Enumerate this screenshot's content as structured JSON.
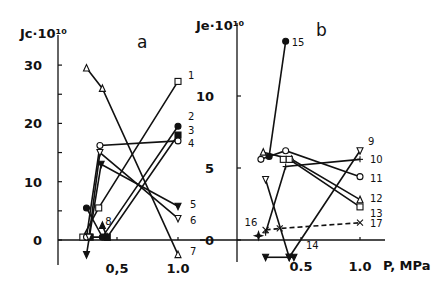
{
  "figure": {
    "panel_a_label": "a",
    "panel_b_label": "b",
    "y_axis_title_a": "Jc·10¹⁰",
    "y_axis_title_b": "Je·10¹⁰",
    "x_axis_title": "P, MPa",
    "ink_color": "#111111",
    "background": "#ffffff"
  },
  "chart_data": [
    {
      "panel": "a",
      "type": "line",
      "title": "a",
      "xlabel": "P, MPa",
      "ylabel": "Jc·10¹⁰",
      "xlim": [
        0.0,
        1.1
      ],
      "ylim": [
        -5,
        33
      ],
      "x_ticks": [
        {
          "value": 0.5,
          "label": "0,5"
        },
        {
          "value": 1.0,
          "label": "1.0"
        }
      ],
      "y_ticks": [
        {
          "value": 0,
          "label": "0"
        },
        {
          "value": 5,
          "label": ""
        },
        {
          "value": 10,
          "label": "10"
        },
        {
          "value": 15,
          "label": ""
        },
        {
          "value": 20,
          "label": "20"
        },
        {
          "value": 25,
          "label": ""
        },
        {
          "value": 30,
          "label": "30"
        }
      ],
      "grid": false,
      "series": [
        {
          "name": "1",
          "marker": "open-square",
          "x": [
            0.22,
            0.35,
            1.0
          ],
          "y": [
            0.5,
            5.5,
            27.2
          ]
        },
        {
          "name": "2",
          "marker": "filled-circle",
          "x": [
            0.25,
            0.38,
            1.0
          ],
          "y": [
            5.5,
            0.5,
            19.5
          ]
        },
        {
          "name": "3",
          "marker": "filled-square",
          "x": [
            0.28,
            0.42,
            1.0
          ],
          "y": [
            0.5,
            0.5,
            18.0
          ]
        },
        {
          "name": "4",
          "marker": "open-circle",
          "x": [
            0.25,
            0.36,
            1.0
          ],
          "y": [
            0.5,
            16.2,
            17.0
          ]
        },
        {
          "name": "5",
          "marker": "filled-down-triangle",
          "x": [
            0.25,
            0.37,
            1.0
          ],
          "y": [
            -2.5,
            13.0,
            5.8
          ]
        },
        {
          "name": "6",
          "marker": "open-down-triangle",
          "x": [
            0.27,
            0.36,
            1.0
          ],
          "y": [
            0.5,
            15.0,
            3.7
          ]
        },
        {
          "name": "7",
          "marker": "open-triangle",
          "x": [
            0.25,
            0.38,
            1.0
          ],
          "y": [
            29.5,
            26.0,
            -2.5
          ]
        },
        {
          "name": "8",
          "marker": "filled-triangle",
          "x": [
            0.38,
            0.42
          ],
          "y": [
            2.5,
            0.5
          ]
        }
      ]
    },
    {
      "panel": "b",
      "type": "line",
      "title": "b",
      "xlabel": "P, MPa",
      "ylabel": "Je·10¹⁰",
      "xlim": [
        0.0,
        1.1
      ],
      "ylim": [
        -1.5,
        15
      ],
      "x_ticks": [
        {
          "value": 0.5,
          "label": "0.5"
        },
        {
          "value": 1.0,
          "label": "1.0"
        }
      ],
      "y_ticks": [
        {
          "value": 0,
          "label": "0"
        },
        {
          "value": 5,
          "label": "5"
        },
        {
          "value": 10,
          "label": "10"
        }
      ],
      "grid": false,
      "series": [
        {
          "name": "9",
          "marker": "open-down-triangle",
          "x": [
            0.2,
            0.4,
            1.0
          ],
          "y": [
            4.2,
            -1.2,
            6.2
          ]
        },
        {
          "name": "10",
          "marker": "plus",
          "x": [
            0.2,
            0.37,
            1.0
          ],
          "y": [
            0.5,
            5.1,
            5.6
          ]
        },
        {
          "name": "11",
          "marker": "open-circle",
          "x": [
            0.16,
            0.37,
            1.0
          ],
          "y": [
            5.6,
            6.2,
            4.4
          ]
        },
        {
          "name": "12",
          "marker": "open-triangle",
          "x": [
            0.18,
            0.42,
            1.0
          ],
          "y": [
            6.1,
            5.6,
            2.8
          ]
        },
        {
          "name": "13",
          "marker": "open-square",
          "x": [
            0.35,
            0.4,
            1.0
          ],
          "y": [
            5.6,
            5.6,
            2.3
          ]
        },
        {
          "name": "14",
          "marker": "filled-down-triangle",
          "x": [
            0.2,
            0.4,
            0.44
          ],
          "y": [
            -1.2,
            -1.2,
            -1.2
          ]
        },
        {
          "name": "15",
          "marker": "filled-circle",
          "x": [
            0.23,
            0.37
          ],
          "y": [
            5.8,
            13.8
          ]
        },
        {
          "name": "16",
          "marker": "filled-star",
          "x": [
            0.14
          ],
          "y": [
            0.3
          ]
        },
        {
          "name": "17",
          "marker": "x-cross",
          "line": "dashed",
          "x": [
            0.2,
            0.32,
            1.0
          ],
          "y": [
            0.7,
            0.8,
            1.2
          ]
        }
      ]
    }
  ]
}
